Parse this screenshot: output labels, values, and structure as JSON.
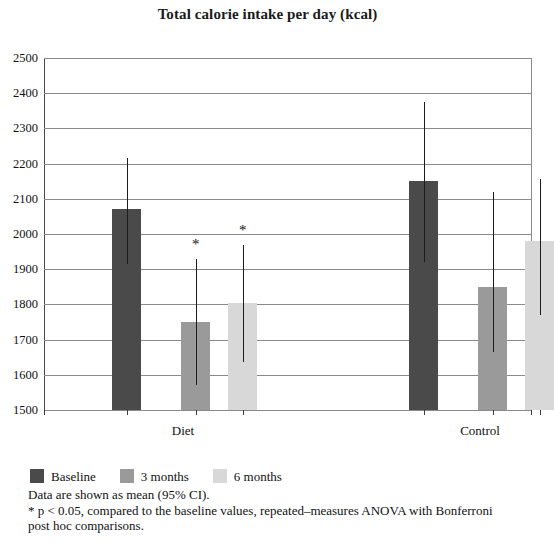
{
  "chart_data": {
    "type": "bar",
    "title": "Total calorie intake per day (kcal)",
    "xlabel": "",
    "ylabel": "",
    "ylim": [
      1500,
      2500
    ],
    "ytick_step": 100,
    "yticks": [
      2500,
      2400,
      2300,
      2200,
      2100,
      2000,
      1900,
      1800,
      1700,
      1600,
      1500
    ],
    "grid": true,
    "legend_position": "bottom-left",
    "categories": [
      "Diet",
      "Control"
    ],
    "series": [
      {
        "name": "Baseline",
        "color": "#4a4a4a",
        "values": [
          2070,
          2150
        ],
        "ci_low": [
          1915,
          1920
        ],
        "ci_high": [
          2215,
          2375
        ],
        "significant": [
          false,
          false
        ]
      },
      {
        "name": "3 months",
        "color": "#9a9a9a",
        "values": [
          1750,
          1850
        ],
        "ci_low": [
          1570,
          1665
        ],
        "ci_high": [
          1930,
          2120
        ],
        "significant": [
          true,
          false
        ]
      },
      {
        "name": "6 months",
        "color": "#d8d8d8",
        "values": [
          1805,
          1980
        ],
        "ci_low": [
          1635,
          1770
        ],
        "ci_high": [
          1970,
          2155
        ],
        "significant": [
          true,
          false
        ]
      }
    ],
    "annotations": [
      {
        "symbol": "*",
        "group": "Diet",
        "series": "3 months"
      },
      {
        "symbol": "*",
        "group": "Diet",
        "series": "6 months"
      },
      {
        "symbol": "*",
        "group": "Control",
        "series": "3 months"
      }
    ]
  },
  "legend": {
    "items": [
      {
        "label": "Baseline",
        "color": "#4a4a4a"
      },
      {
        "label": "3 months",
        "color": "#9a9a9a"
      },
      {
        "label": "6 months",
        "color": "#d8d8d8"
      }
    ]
  },
  "footnotes": {
    "line1": "Data are shown as mean (95% CI).",
    "line2": "* p < 0.05, compared to the baseline values, repeated–measures ANOVA with Bonferroni",
    "line3": "post hoc comparisons."
  }
}
